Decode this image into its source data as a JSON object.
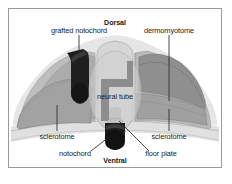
{
  "figure": {
    "orientation": {
      "dorsal": "Dorsal",
      "ventral": "Ventral"
    },
    "labels": {
      "grafted_notochord": "grafted notochord",
      "dermomyotome": "dermomyotome",
      "neural_tube": "neural tube",
      "sclerotome_left": "sclerotome",
      "sclerotome_right": "sclerotome",
      "notochord": "notochord",
      "floor_plate": "floor plate"
    },
    "colors": {
      "frame_border": "#9a9a9a",
      "background": "#ffffff",
      "ectoderm_pale": "#e3e3e3",
      "somite_mid_gray": "#b0b0b0",
      "sclerotome_gray": "#9c9c9c",
      "dermomyotome_gray": "#8d8d8d",
      "neural_tube_light": "#d2d2d2",
      "neural_lumen_dark": "#7a7a7a",
      "notochord_black": "#1c1c1c",
      "grafted_notochord_black": "#202020",
      "leader_line": "#2a2a2a",
      "text": "#1a1a1a"
    }
  }
}
